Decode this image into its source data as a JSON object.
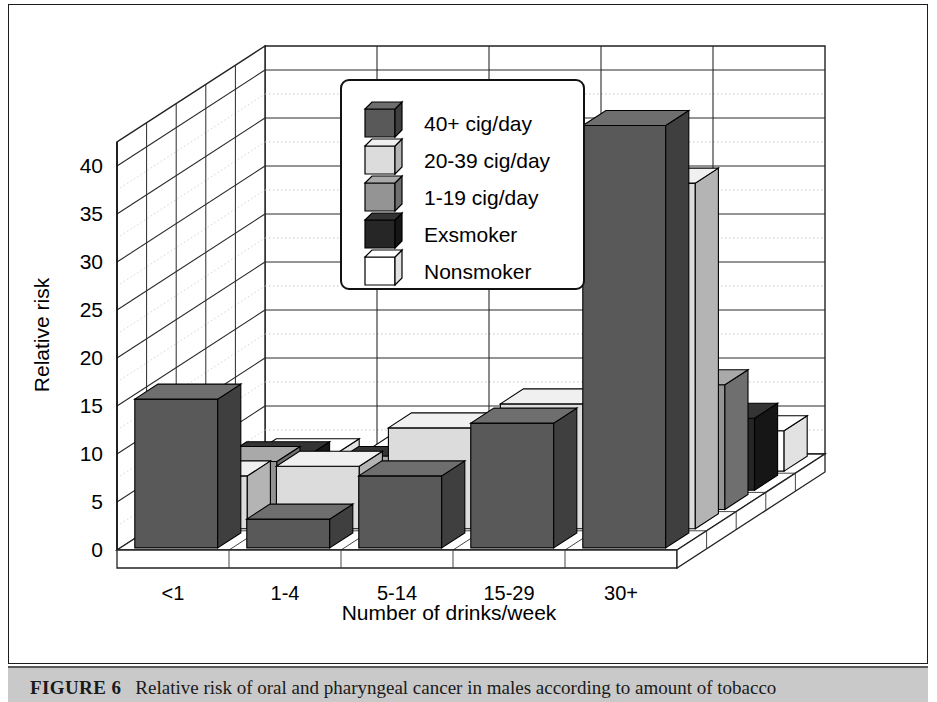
{
  "figure": {
    "label": "FIGURE 6",
    "caption": "Relative risk of oral and pharyngeal cancer in males according to amount of tobacco"
  },
  "chart_data": {
    "type": "bar",
    "subtype": "3d-grouped-bar",
    "title": "",
    "xlabel": "Number of drinks/week",
    "ylabel": "Relative risk",
    "categories": [
      "<1",
      "1-4",
      "5-14",
      "15-29",
      "30+"
    ],
    "ylim": [
      0,
      42.5
    ],
    "yticks": [
      0,
      5,
      10,
      15,
      20,
      25,
      30,
      35,
      40
    ],
    "ytick_labels": [
      "0",
      "5",
      "10",
      "15",
      "20",
      "25",
      "30",
      "35",
      "40"
    ],
    "minor_tick_step": 2.5,
    "grid": true,
    "legend_position": "upper-left-inside",
    "series": [
      {
        "name": "40+ cig/day",
        "color": "#595959",
        "top_color": "#6e6e6e",
        "side_color": "#3f3f3f",
        "values": [
          15.5,
          3.0,
          7.5,
          13.0,
          44.0
        ]
      },
      {
        "name": "20-39 cig/day",
        "color": "#dcdcdc",
        "top_color": "#f0f0f0",
        "side_color": "#b4b4b4",
        "values": [
          5.5,
          6.5,
          10.5,
          13.0,
          36.0
        ]
      },
      {
        "name": "1-19 cig/day",
        "color": "#949494",
        "top_color": "#a9a9a9",
        "side_color": "#6f6f6f",
        "values": [
          5.0,
          4.0,
          4.5,
          10.0,
          13.0
        ]
      },
      {
        "name": "Exsmoker",
        "color": "#262626",
        "top_color": "#343434",
        "side_color": "#161616",
        "values": [
          3.5,
          3.0,
          3.5,
          6.5,
          7.5
        ]
      },
      {
        "name": "Nonsmoker",
        "color": "#ffffff",
        "top_color": "#ffffff",
        "side_color": "#e2e2e2",
        "values": [
          1.8,
          2.0,
          2.0,
          2.2,
          4.2
        ]
      }
    ]
  }
}
